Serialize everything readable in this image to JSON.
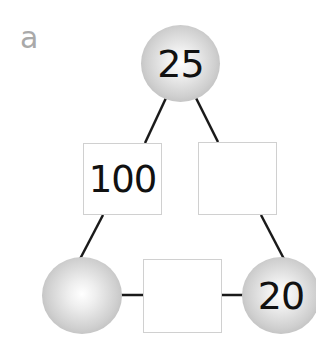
{
  "label": "a",
  "nodes": {
    "top_circle": "25",
    "bottom_left_circle": "",
    "bottom_right_circle": "20"
  },
  "edges": {
    "left_box": "100",
    "right_box": "",
    "bottom_box": ""
  },
  "colors": {
    "line": "#1a1a1a",
    "label": "#a9a9a9",
    "box_border": "#d0d0d0"
  }
}
